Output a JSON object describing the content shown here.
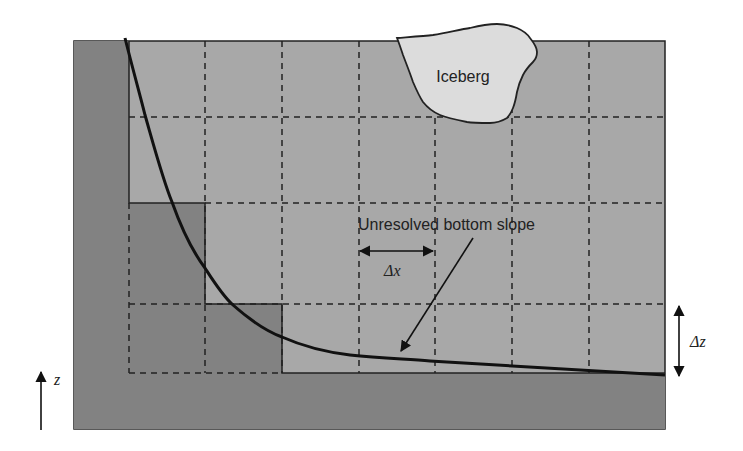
{
  "diagram": {
    "labels": {
      "iceberg": "Iceberg",
      "slope": "Unresolved bottom slope",
      "dx": "Δx",
      "dz": "Δz",
      "z_axis": "z"
    },
    "colors": {
      "fluid": "#a8a8a8",
      "terrain": "#828282",
      "iceberg": "#dcdcdc",
      "line": "#111111",
      "grid_dash": "#222222",
      "background": "#ffffff"
    },
    "grid": {
      "columns_x": [
        129,
        205,
        282,
        359,
        435,
        512,
        589,
        665
      ],
      "rows_y": [
        41,
        117,
        203,
        304,
        373
      ],
      "domain": {
        "left": 74,
        "top": 41,
        "right": 665,
        "bottom": 429
      }
    },
    "terrain_cells": [
      {
        "name": "left-wall",
        "x": 74,
        "y": 41,
        "w": 55,
        "h": 388
      },
      {
        "name": "bottom-floor",
        "x": 74,
        "y": 373,
        "w": 591,
        "h": 56
      },
      {
        "name": "step-1",
        "x": 129,
        "y": 203,
        "w": 76,
        "h": 170
      },
      {
        "name": "step-2",
        "x": 205,
        "y": 304,
        "w": 77,
        "h": 69
      }
    ]
  }
}
